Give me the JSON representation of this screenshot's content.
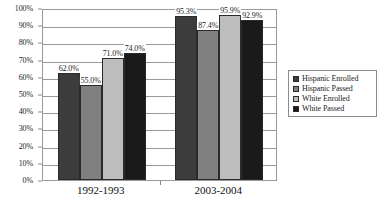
{
  "chart_data": {
    "type": "bar",
    "title": "",
    "xlabel": "",
    "ylabel": "",
    "ylim": [
      0,
      100
    ],
    "grid": true,
    "legend_position": "right",
    "categories": [
      "1992-1993",
      "2003-2004"
    ],
    "y_ticks": [
      "0%",
      "10%",
      "20%",
      "30%",
      "40%",
      "50%",
      "60%",
      "70%",
      "80%",
      "90%",
      "100%"
    ],
    "y_tick_values": [
      0,
      10,
      20,
      30,
      40,
      50,
      60,
      70,
      80,
      90,
      100
    ],
    "series": [
      {
        "name": "Hispanic Enrolled",
        "color": "#3c3c3c",
        "values": [
          62.0,
          95.3
        ],
        "labels": [
          "62.0%",
          "95.3%"
        ]
      },
      {
        "name": "Hispanic Passed",
        "color": "#808080",
        "values": [
          55.0,
          87.4
        ],
        "labels": [
          "55.0%",
          "87.4%"
        ]
      },
      {
        "name": "White Enrolled",
        "color": "#bdbdbd",
        "values": [
          71.0,
          95.9
        ],
        "labels": [
          "71.0%",
          "95.9%"
        ]
      },
      {
        "name": "White Passed",
        "color": "#1a1a1a",
        "values": [
          74.0,
          92.9
        ],
        "labels": [
          "74.0%",
          "92.9%"
        ]
      }
    ]
  },
  "legend": {
    "items": [
      {
        "label": "Hispanic Enrolled",
        "color": "#3c3c3c"
      },
      {
        "label": "Hispanic Passed",
        "color": "#808080"
      },
      {
        "label": "White Enrolled",
        "color": "#bdbdbd"
      },
      {
        "label": "White Passed",
        "color": "#1a1a1a"
      }
    ]
  }
}
